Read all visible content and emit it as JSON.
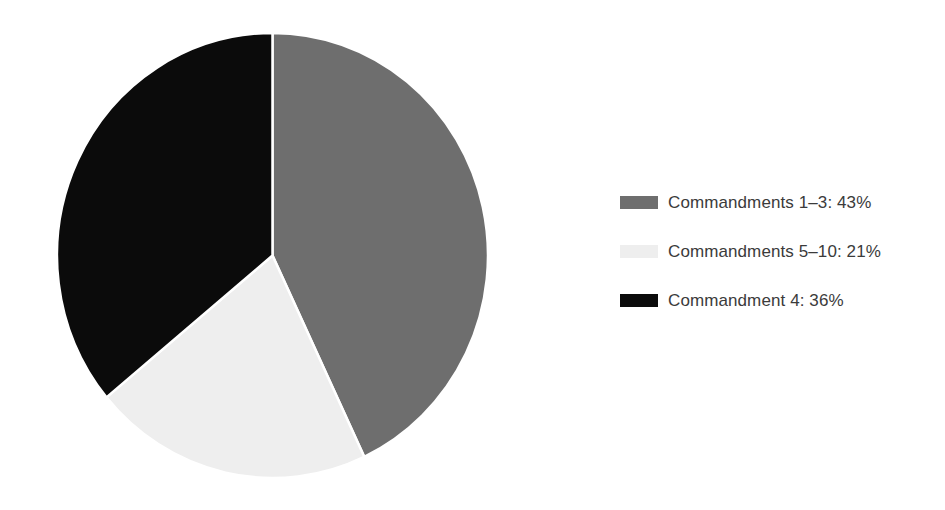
{
  "chart_data": {
    "type": "pie",
    "title": "",
    "subtitle": "",
    "xlabel": "",
    "ylabel": "",
    "grid": false,
    "legend_position": "right",
    "start_angle_deg": 0,
    "direction": "clockwise",
    "categories": [
      "Commandments 1–3",
      "Commandments 5–10",
      "Commandment 4"
    ],
    "values": [
      43,
      21,
      36
    ],
    "value_unit": "%",
    "colors": [
      "#6e6e6e",
      "#eeeeee",
      "#0b0b0b"
    ],
    "slices": [
      {
        "label": "Commandments 1–3",
        "value": 43,
        "display": "43%",
        "color": "#6e6e6e"
      },
      {
        "label": "Commandments 5–10",
        "value": 21,
        "display": "21%",
        "color": "#eeeeee"
      },
      {
        "label": "Commandment 4",
        "value": 36,
        "display": "36%",
        "color": "#0b0b0b"
      }
    ],
    "annotations": []
  },
  "legend": {
    "items": [
      {
        "label": "Commandments 1–3: 43%",
        "color": "#6e6e6e",
        "swatch_name": "legend-swatch-commandments-1-3"
      },
      {
        "label": "Commandments 5–10: 21%",
        "color": "#eeeeee",
        "swatch_name": "legend-swatch-commandments-5-10"
      },
      {
        "label": "Commandment 4: 36%",
        "color": "#0b0b0b",
        "swatch_name": "legend-swatch-commandment-4"
      }
    ]
  },
  "figure": {
    "background": "#ffffff",
    "text_color": "#3b3b3b"
  }
}
